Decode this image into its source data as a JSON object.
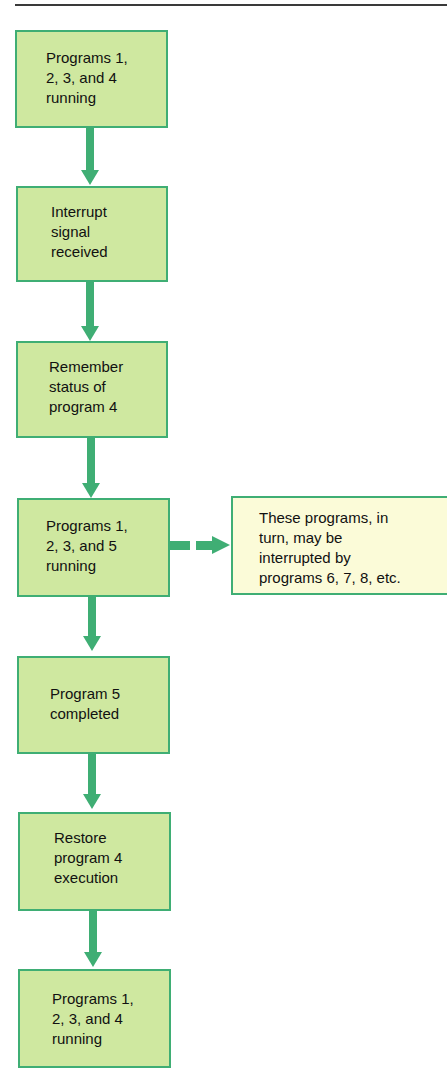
{
  "diagram": {
    "steps": [
      {
        "label": "Programs 1,\n2, 3, and 4\nrunning"
      },
      {
        "label": "Interrupt\nsignal\nreceived"
      },
      {
        "label": "Remember\nstatus of\nprogram 4"
      },
      {
        "label": "Programs 1,\n2, 3, and 5\nrunning"
      },
      {
        "label": "Program 5\ncompleted"
      },
      {
        "label": "Restore\nprogram 4\nexecution"
      },
      {
        "label": "Programs 1,\n2, 3, and 4\nrunning"
      }
    ],
    "side_note": {
      "label": "These programs, in\nturn, may be\ninterrupted by\nprograms 6, 7, 8, etc."
    },
    "colors": {
      "box_fill": "#cfe8a0",
      "note_fill": "#fbfbd8",
      "arrow": "#3fae74",
      "border": "#3fae74"
    }
  }
}
